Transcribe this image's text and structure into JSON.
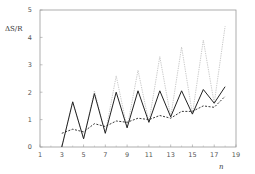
{
  "chart_data": {
    "type": "line",
    "title": "",
    "xlabel": "n",
    "ylabel": "ΔS/R",
    "xlim": [
      1,
      19
    ],
    "ylim": [
      0,
      5
    ],
    "xticks": [
      1,
      3,
      5,
      7,
      9,
      11,
      13,
      15,
      17,
      19
    ],
    "yticks": [
      0,
      1,
      2,
      3,
      4,
      5
    ],
    "grid": false,
    "legend": null,
    "x": [
      3,
      4,
      5,
      6,
      7,
      8,
      9,
      10,
      11,
      12,
      13,
      14,
      15,
      16,
      17,
      18
    ],
    "series": [
      {
        "name": "solid",
        "style": "solid",
        "color": "#222222",
        "values": [
          0.0,
          1.65,
          0.3,
          1.95,
          0.5,
          2.0,
          0.7,
          2.05,
          0.9,
          2.05,
          1.1,
          2.05,
          1.2,
          2.1,
          1.6,
          2.2
        ]
      },
      {
        "name": "dotted",
        "style": "dotted",
        "color": "#aaaaaa",
        "values": [
          0.0,
          1.65,
          0.3,
          2.05,
          0.5,
          2.6,
          0.7,
          2.8,
          0.9,
          3.3,
          1.1,
          3.65,
          1.2,
          3.9,
          1.6,
          4.4
        ]
      },
      {
        "name": "dashed",
        "style": "dashed",
        "color": "#222222",
        "values": [
          0.5,
          0.65,
          0.55,
          0.85,
          0.75,
          0.95,
          0.9,
          1.05,
          1.0,
          1.15,
          1.05,
          1.3,
          1.3,
          1.5,
          1.45,
          1.85
        ]
      }
    ]
  },
  "labels": {
    "ylabel": "ΔS/R",
    "xlabel": "n"
  }
}
